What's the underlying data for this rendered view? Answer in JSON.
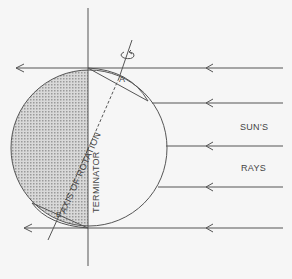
{
  "diagram": {
    "type": "sun-earth illumination diagram",
    "labels": {
      "suns": "SUN'S",
      "rays": "RAYS",
      "terminator": "TERMINATOR",
      "axis": "AXIS OF ROTATION",
      "point_a": "A",
      "point_b": "B"
    },
    "colors": {
      "background": "#f6f6f6",
      "line": "#555555",
      "shade": "#bdbdbd"
    },
    "rays_y": [
      68,
      103,
      146,
      187,
      228
    ]
  }
}
